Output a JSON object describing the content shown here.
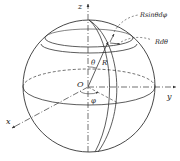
{
  "diagram": {
    "axes": {
      "x_label": "x",
      "y_label": "y",
      "z_label": "z"
    },
    "labels": {
      "origin": "O",
      "theta": "θ",
      "radius": "R",
      "phi": "φ",
      "arc_phi": "Rsinθdφ",
      "arc_theta": "Rdθ"
    },
    "colors": {
      "stroke": "#333333",
      "background": "#ffffff"
    }
  }
}
